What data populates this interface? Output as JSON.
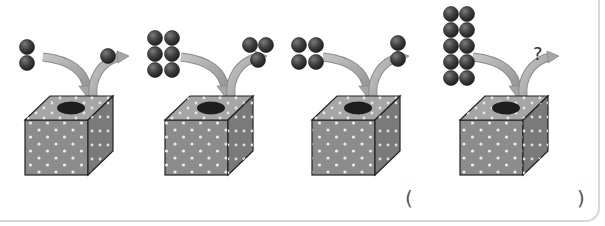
{
  "problem": {
    "description": "Magic box: balls go in, balls come out",
    "examples": [
      {
        "in": 2,
        "out": 1
      },
      {
        "in": 6,
        "out": 3
      },
      {
        "in": 4,
        "out": 2
      },
      {
        "in": 10,
        "out": "?"
      }
    ],
    "unknown_label": "?",
    "answer": {
      "open_paren": "(",
      "close_paren": ")",
      "value": ""
    }
  },
  "colors": {
    "ball": "#3a3a3a",
    "ball_highlight": "#6e6e6e",
    "arrow": "#a9a9a9",
    "box_front": "#8c8c8c",
    "box_top": "#a6a6a6",
    "box_side": "#7a7a7a",
    "hole": "#1e1e1e",
    "dot": "#e8e8e8"
  }
}
